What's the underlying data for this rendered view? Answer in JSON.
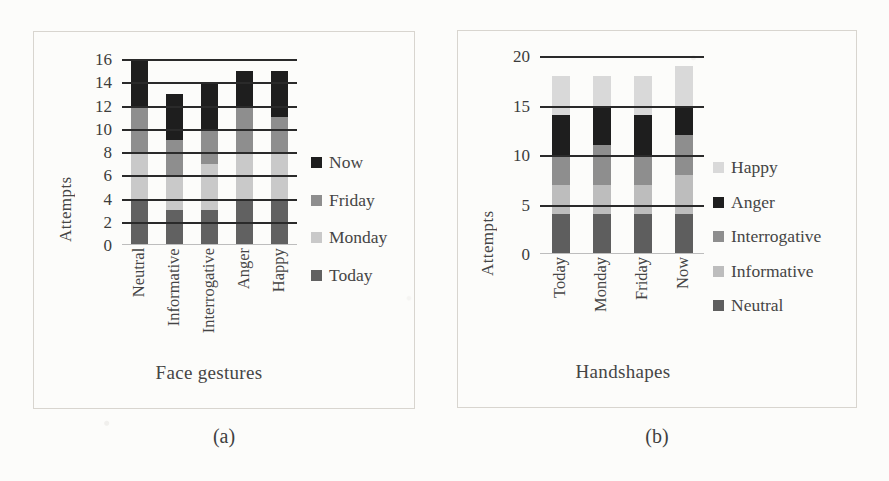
{
  "figure": {
    "panels": [
      {
        "caption": "(a)",
        "xlabel": "Face gestures",
        "ylabel": "Attempts"
      },
      {
        "caption": "(b)",
        "xlabel": "Handshapes",
        "ylabel": "Attempts"
      }
    ]
  },
  "colors": {
    "now": "#1e1e1e",
    "anger": "#1e1e1e",
    "friday": "#8e8e8e",
    "interrogative": "#8e8e8e",
    "monday": "#c9c9c9",
    "informative": "#bdbdbd",
    "today": "#616161",
    "neutral": "#5e5e5e",
    "happy": "#d9d9d9",
    "gridline": "#2a2a2a",
    "frame": "#d8d5cf",
    "text": "#454545",
    "background": "#fcfcfa"
  },
  "chart_data": [
    {
      "type": "bar",
      "title": "",
      "subtitle": "(a)",
      "stacked": true,
      "xlabel": "Face gestures",
      "ylabel": "Attempts",
      "ylim": [
        0,
        16
      ],
      "ytick_labels": [
        "16",
        "14",
        "12",
        "10",
        "8",
        "6",
        "4",
        "2",
        "0"
      ],
      "yticks": [
        16,
        14,
        12,
        10,
        8,
        6,
        4,
        2,
        0
      ],
      "grid": true,
      "legend_position": "right",
      "categories": [
        "Neutral",
        "Informative",
        "Interrogative",
        "Anger",
        "Happy"
      ],
      "series": [
        {
          "name": "Today",
          "color": "#616161",
          "values": [
            4,
            3,
            3,
            4,
            4
          ]
        },
        {
          "name": "Monday",
          "color": "#c9c9c9",
          "values": [
            4,
            3,
            4,
            4,
            4
          ]
        },
        {
          "name": "Friday",
          "color": "#8e8e8e",
          "values": [
            4,
            3,
            3,
            4,
            3
          ]
        },
        {
          "name": "Now",
          "color": "#1e1e1e",
          "values": [
            4,
            4,
            4,
            3,
            4
          ]
        }
      ],
      "legend_order": [
        "Now",
        "Friday",
        "Monday",
        "Today"
      ],
      "totals": [
        16,
        13,
        14,
        15,
        15
      ]
    },
    {
      "type": "bar",
      "title": "",
      "subtitle": "(b)",
      "stacked": true,
      "xlabel": "Handshapes",
      "ylabel": "Attempts",
      "ylim": [
        0,
        20
      ],
      "ytick_labels": [
        "20",
        "15",
        "10",
        "5",
        "0"
      ],
      "yticks": [
        20,
        15,
        10,
        5,
        0
      ],
      "grid": true,
      "legend_position": "right",
      "categories": [
        "Today",
        "Monday",
        "Friday",
        "Now"
      ],
      "series": [
        {
          "name": "Neutral",
          "color": "#5e5e5e",
          "values": [
            4,
            4,
            4,
            4
          ]
        },
        {
          "name": "Informative",
          "color": "#bdbdbd",
          "values": [
            3,
            3,
            3,
            4
          ]
        },
        {
          "name": "Interrogative",
          "color": "#8e8e8e",
          "values": [
            3,
            4,
            3,
            4
          ]
        },
        {
          "name": "Anger",
          "color": "#1e1e1e",
          "values": [
            4,
            4,
            4,
            3
          ]
        },
        {
          "name": "Happy",
          "color": "#d9d9d9",
          "values": [
            4,
            3,
            4,
            4
          ]
        }
      ],
      "legend_order": [
        "Happy",
        "Anger",
        "Interrogative",
        "Informative",
        "Neutral"
      ],
      "totals": [
        18,
        18,
        18,
        19
      ]
    }
  ]
}
